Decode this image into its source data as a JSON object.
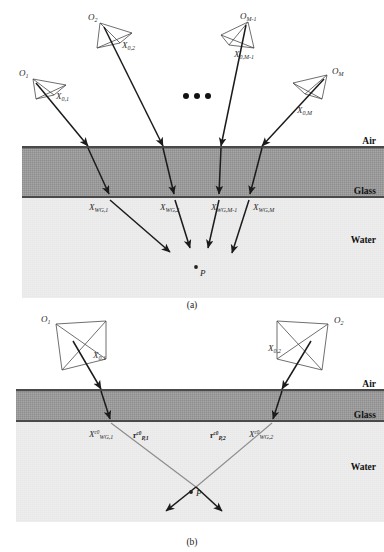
{
  "figure": {
    "panels": [
      {
        "id": "a",
        "caption": "(a)",
        "layers": [
          {
            "name": "Air",
            "label": "Air",
            "color": "#ffffff"
          },
          {
            "name": "Glass",
            "label": "Glass",
            "color": "#9a9a9a"
          },
          {
            "name": "Water",
            "label": "Water",
            "color": "#ececec"
          }
        ],
        "cameras": [
          {
            "origin": "O",
            "origin_sub": "1",
            "ray_label": "X",
            "ray_sub": "0,1"
          },
          {
            "origin": "O",
            "origin_sub": "2",
            "ray_label": "X",
            "ray_sub": "0,2"
          },
          {
            "origin": "O",
            "origin_sub": "M-1",
            "ray_label": "X",
            "ray_sub": "0,M-1"
          },
          {
            "origin": "O",
            "origin_sub": "M",
            "ray_label": "X",
            "ray_sub": "0,M"
          }
        ],
        "interface_points": [
          {
            "symbol": "X",
            "sub": "WG,1"
          },
          {
            "symbol": "X",
            "sub": "WG,2"
          },
          {
            "symbol": "X",
            "sub": "WG,M-1"
          },
          {
            "symbol": "X",
            "sub": "WG,M"
          }
        ],
        "ellipsis": "•••",
        "scene_point": "P"
      },
      {
        "id": "b",
        "caption": "(b)",
        "layers": [
          {
            "name": "Air",
            "label": "Air",
            "color": "#ffffff"
          },
          {
            "name": "Glass",
            "label": "Glass",
            "color": "#9a9a9a"
          },
          {
            "name": "Water",
            "label": "Water",
            "color": "#ececec"
          }
        ],
        "cameras": [
          {
            "origin": "O",
            "origin_sub": "1",
            "ray_label": "X",
            "ray_sub": "0,1"
          },
          {
            "origin": "O",
            "origin_sub": "2",
            "ray_label": "X",
            "ray_sub": "0,2"
          }
        ],
        "interface_points": [
          {
            "symbol": "X",
            "sup": "c0",
            "sub": "WG,1"
          },
          {
            "symbol": "X",
            "sup": "c0",
            "sub": "WG,2"
          }
        ],
        "refracted_vectors": [
          {
            "symbol": "r",
            "sup": "c0",
            "sub": "P,1"
          },
          {
            "symbol": "r",
            "sup": "c0",
            "sub": "P,2"
          }
        ],
        "scene_point": "P"
      }
    ]
  }
}
